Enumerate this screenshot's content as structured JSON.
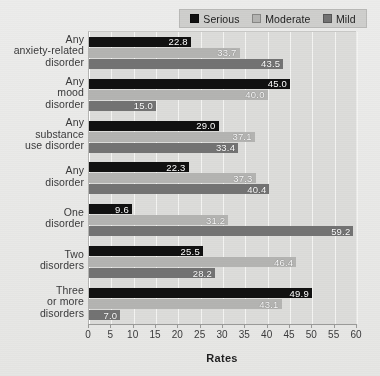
{
  "chart_data": {
    "type": "bar",
    "orientation": "horizontal",
    "title": "",
    "xlabel": "Rates",
    "ylabel": "",
    "xlim": [
      0,
      60
    ],
    "xticks": [
      0,
      5,
      10,
      15,
      20,
      25,
      30,
      35,
      40,
      45,
      50,
      55,
      60
    ],
    "grid": true,
    "legend_position": "top-right",
    "categories": [
      "Any anxiety-related disorder",
      "Any mood disorder",
      "Any substance use disorder",
      "Any disorder",
      "One disorder",
      "Two disorders",
      "Three or more disorders"
    ],
    "category_lines": [
      [
        "Any",
        "anxiety-related",
        "disorder"
      ],
      [
        "Any",
        "mood",
        "disorder"
      ],
      [
        "Any",
        "substance",
        "use disorder"
      ],
      [
        "Any",
        "disorder"
      ],
      [
        "One",
        "disorder"
      ],
      [
        "Two",
        "disorders"
      ],
      [
        "Three",
        "or more",
        "disorders"
      ]
    ],
    "series": [
      {
        "name": "Serious",
        "color": "#111111",
        "values": [
          22.8,
          45.0,
          29.0,
          22.3,
          9.6,
          25.5,
          49.9
        ]
      },
      {
        "name": "Moderate",
        "color": "#b4b4b2",
        "values": [
          33.7,
          40.0,
          37.1,
          37.3,
          31.2,
          46.4,
          43.1
        ]
      },
      {
        "name": "Mild",
        "color": "#737373",
        "values": [
          43.5,
          15.0,
          33.4,
          40.4,
          59.2,
          28.2,
          7.0
        ]
      }
    ]
  },
  "legend": {
    "items": [
      {
        "label": "Serious",
        "color": "#111111"
      },
      {
        "label": "Moderate",
        "color": "#b4b4b2"
      },
      {
        "label": "Mild",
        "color": "#737373"
      }
    ]
  },
  "axis": {
    "x_title": "Rates"
  }
}
